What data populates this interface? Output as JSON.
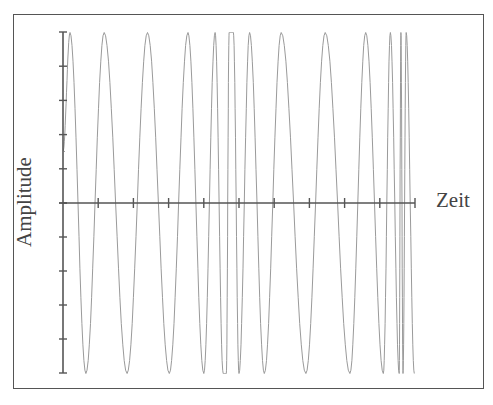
{
  "chart_data": {
    "type": "line",
    "title": "",
    "xlabel": "Zeit",
    "ylabel": "Amplitude",
    "grid": false,
    "legend": null,
    "x_ticks_count": 10,
    "y_ticks_count_each_side": 5,
    "ylim": [
      -1,
      1
    ],
    "xlim": [
      0,
      1
    ],
    "base_period_fraction": 0.113,
    "bursts": [
      {
        "x_start": 0.44,
        "x_end": 0.49
      },
      {
        "x_start": 0.93,
        "x_end": 0.99
      }
    ],
    "peaks_x": [
      0.02,
      0.117,
      0.24,
      0.355,
      0.432,
      0.472,
      0.484,
      0.53,
      0.62,
      0.745,
      0.86,
      0.93,
      0.96,
      0.975
    ],
    "troughs_x": [
      0.065,
      0.182,
      0.302,
      0.4,
      0.455,
      0.464,
      0.5,
      0.572,
      0.69,
      0.815,
      0.91,
      0.955,
      0.966,
      0.998
    ]
  },
  "colors": {
    "axis": "#555555",
    "signal": "#9a9a9a",
    "frame": "#555555",
    "text": "#444444"
  }
}
